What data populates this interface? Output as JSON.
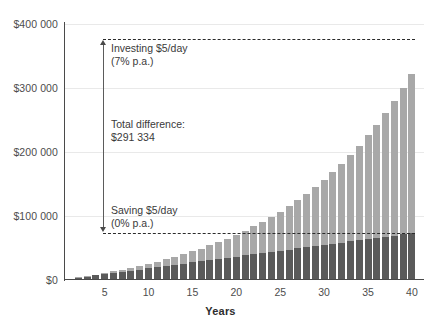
{
  "chart_data": {
    "type": "bar",
    "title": "",
    "subtitle": "",
    "xlabel": "Years",
    "ylabel": "",
    "stacked": true,
    "grid": true,
    "legend_position": "none",
    "xlim": [
      0,
      41
    ],
    "ylim": [
      0,
      400000
    ],
    "x": [
      1,
      2,
      3,
      4,
      5,
      6,
      7,
      8,
      9,
      10,
      11,
      12,
      13,
      14,
      15,
      16,
      17,
      18,
      19,
      20,
      21,
      22,
      23,
      24,
      25,
      26,
      27,
      28,
      29,
      30,
      31,
      32,
      33,
      34,
      35,
      36,
      37,
      38,
      39,
      40
    ],
    "categories": [
      "1",
      "2",
      "3",
      "4",
      "5",
      "6",
      "7",
      "8",
      "9",
      "10",
      "11",
      "12",
      "13",
      "14",
      "15",
      "16",
      "17",
      "18",
      "19",
      "20",
      "21",
      "22",
      "23",
      "24",
      "25",
      "26",
      "27",
      "28",
      "29",
      "30",
      "31",
      "32",
      "33",
      "34",
      "35",
      "36",
      "37",
      "38",
      "39",
      "40"
    ],
    "series": [
      {
        "name": "Saving $5/day (0% p.a.)",
        "color": "#5a5a5a",
        "values": [
          1825,
          3650,
          5475,
          7300,
          9125,
          10950,
          12775,
          14600,
          16425,
          18250,
          20075,
          21900,
          23725,
          25550,
          27375,
          29200,
          31025,
          32850,
          34675,
          36500,
          38325,
          40150,
          41975,
          43800,
          45625,
          47450,
          49275,
          51100,
          52925,
          54750,
          56575,
          58400,
          60225,
          62050,
          63875,
          65700,
          67525,
          69350,
          71175,
          73000
        ]
      },
      {
        "name": "Investing $5/day (7% p.a.)",
        "color": "#a8a8a8",
        "values": [
          1953,
          4013,
          6187,
          8483,
          10910,
          13476,
          16193,
          19059,
          22096,
          25316,
          28731,
          32355,
          36193,
          40264,
          44575,
          49184,
          54070,
          59258,
          64797,
          70677,
          76977,
          83692,
          90863,
          98510,
          106679,
          115400,
          124715,
          134660,
          145281,
          156619,
          168725,
          181648,
          195448,
          210177,
          225905,
          242693,
          260616,
          279751,
          300177,
          321993
        ]
      }
    ],
    "total_bar_values_year40": 364334,
    "reference_lines": [
      {
        "name": "investing-total-line",
        "value": 364334,
        "style": "dashed"
      },
      {
        "name": "saving-total-line",
        "value": 73000,
        "style": "dashed"
      }
    ],
    "ytick_labels": [
      "$400 000",
      "$300 000",
      "$200 000",
      "$100 000",
      "$0"
    ],
    "ytick_values": [
      400000,
      300000,
      200000,
      100000,
      0
    ],
    "xtick_labels": [
      "5",
      "10",
      "15",
      "20",
      "25",
      "30",
      "35",
      "40"
    ],
    "xtick_values": [
      5,
      10,
      15,
      20,
      25,
      30,
      35,
      40
    ],
    "annotations": [
      {
        "name": "investing-annotation",
        "line1": "Investing $5/day",
        "line2": "(7% p.a.)",
        "at_value": 364334
      },
      {
        "name": "total-difference-annotation",
        "line1": "Total difference:",
        "line2": "$291 334",
        "at_value": 218667
      },
      {
        "name": "saving-annotation",
        "line1": "Saving $5/day",
        "line2": "(0% p.a.)",
        "at_value": 73000
      }
    ],
    "colors": {
      "bar_savings": "#5a5a5a",
      "bar_investment_growth": "#a8a8a8",
      "axis": "#4a4a4a",
      "gridline": "#e9e9e9",
      "dashed_line": "#2b2b2b",
      "text": "#3a3a3a",
      "background": "#ffffff"
    }
  }
}
